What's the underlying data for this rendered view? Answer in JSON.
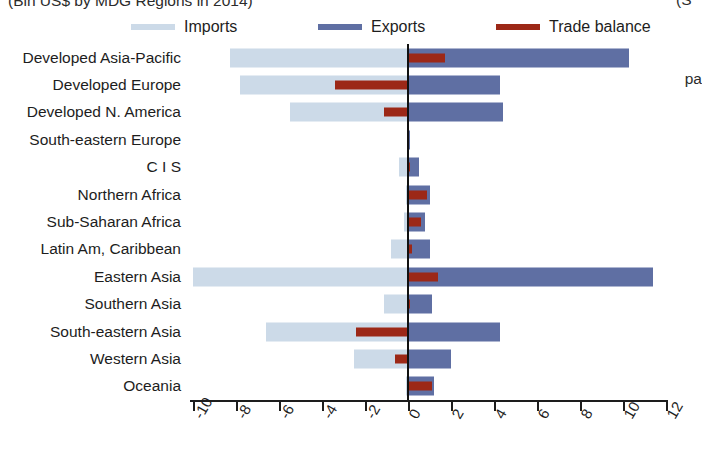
{
  "figure": {
    "title": "(Bln US$ by MDG Regions in 2014)",
    "edge_fragments": {
      "top_right": "(S",
      "mid_right": "pa"
    }
  },
  "legend": {
    "position": "top",
    "items": [
      {
        "label": "Imports",
        "color": "#ccdae8"
      },
      {
        "label": "Exports",
        "color": "#5f6fa3"
      },
      {
        "label": "Trade balance",
        "color": "#9c2817"
      }
    ]
  },
  "axis": {
    "xlabel": "",
    "ylabel": "",
    "xticks": [
      "-10",
      "-8",
      "-6",
      "-4",
      "-2",
      "0",
      "2",
      "4",
      "6",
      "8",
      "10",
      "12"
    ],
    "xmin": -10,
    "xmax": 12,
    "grid": false
  },
  "chart_data": {
    "type": "bar",
    "orientation": "horizontal",
    "title": "(Bln US$ by MDG Regions in 2014)",
    "xlabel": "",
    "ylabel": "",
    "xlim": [
      -10,
      12
    ],
    "grid": false,
    "legend_position": "top",
    "categories": [
      "Developed Asia-Pacific",
      "Developed Europe",
      "Developed N. America",
      "South-eastern Europe",
      "C I S",
      "Northern Africa",
      "Sub-Saharan Africa",
      "Latin Am, Caribbean",
      "Eastern Asia",
      "Southern Asia",
      "South-eastern Asia",
      "Western Asia",
      "Oceania"
    ],
    "series": [
      {
        "name": "Imports",
        "color": "#ccdae8",
        "values": [
          -8.3,
          -7.8,
          -5.5,
          -0.05,
          -0.4,
          -0.1,
          -0.2,
          -0.8,
          -10.0,
          -1.1,
          -6.6,
          -2.5,
          -0.1
        ]
      },
      {
        "name": "Exports",
        "color": "#5f6fa3",
        "values": [
          10.3,
          4.3,
          4.4,
          0.05,
          0.5,
          1.0,
          0.8,
          1.0,
          11.4,
          1.1,
          4.3,
          2.0,
          1.2
        ]
      },
      {
        "name": "Trade balance",
        "color": "#9c2817",
        "values": [
          1.7,
          -3.4,
          -1.1,
          0.0,
          0.1,
          0.9,
          0.6,
          0.2,
          1.4,
          0.1,
          -2.4,
          -0.6,
          1.1
        ]
      }
    ]
  }
}
